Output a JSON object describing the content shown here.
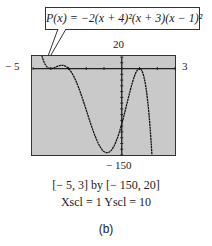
{
  "callout": {
    "text": "P(x) = −2(x + 4)²(x + 3)(x − 1)²"
  },
  "labels": {
    "ymax": "20",
    "ymin": "− 150",
    "xmin": "− 5",
    "xmax": "3"
  },
  "caption": {
    "window": "[− 5, 3]  by  [− 150, 20]",
    "scale": "Xscl = 1        Yscl = 10",
    "part": "(b)"
  },
  "chart_data": {
    "type": "line",
    "function": "-2*(x+4)^2*(x+3)*(x-1)^2",
    "xlim": [
      -5,
      3
    ],
    "ylim": [
      -150,
      20
    ],
    "xscl": 1,
    "yscl": 10,
    "grid": false,
    "series": [
      {
        "name": "P(x)",
        "x": [
          -5,
          -4.75,
          -4.5,
          -4.25,
          -4,
          -3.75,
          -3.5,
          -3.25,
          -3,
          -2.5,
          -2,
          -1.5,
          -1,
          -0.5,
          0,
          0.5,
          1,
          1.5,
          2,
          2.5
        ],
        "values": [
          144,
          47.2,
          14.6,
          2.3,
          0,
          -0.7,
          -5.1,
          -12.8,
          0,
          -42.9,
          -72,
          -91.9,
          -96,
          -79.9,
          -48,
          -12.4,
          0,
          -12.4,
          -72,
          -200
        ]
      }
    ]
  }
}
